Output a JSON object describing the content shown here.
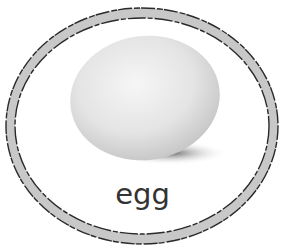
{
  "card": {
    "label": "egg",
    "image_subject": "egg-photo",
    "frame_color": "#c8c8c8",
    "frame_outline_color": "#2a2a2a",
    "egg_color": "#e6e6e6",
    "text_color": "#333333"
  }
}
